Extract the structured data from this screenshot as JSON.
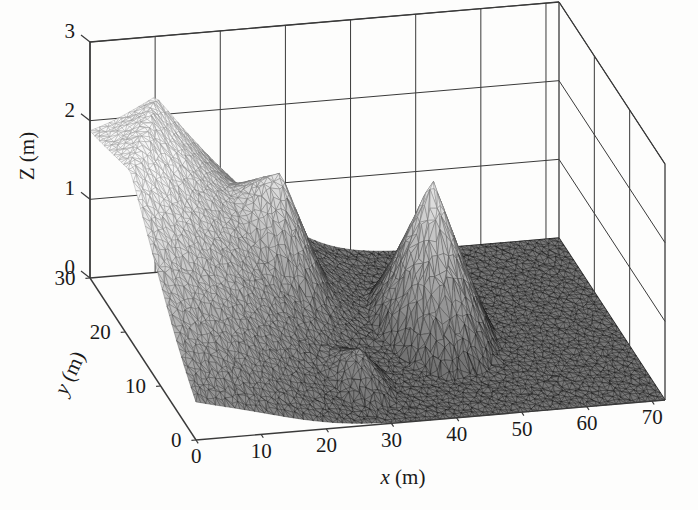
{
  "figure": {
    "type": "surface-plot-3d",
    "background_color": "#fdfdfc",
    "line_color": "#3a3a3a"
  },
  "axes": {
    "x": {
      "label_italic": "x",
      "label_unit": "(m)",
      "label_full": "x (m)",
      "ticks": [
        0,
        10,
        20,
        30,
        40,
        50,
        60,
        70
      ],
      "tick_labels": [
        "0",
        "10",
        "20",
        "30",
        "40",
        "50",
        "60",
        "70"
      ],
      "min": 0,
      "max": 72
    },
    "y": {
      "label_italic": "y",
      "label_unit": "(m)",
      "label_full": "y (m)",
      "ticks": [
        0,
        10,
        20,
        30
      ],
      "tick_labels": [
        "0",
        "10",
        "20",
        "30"
      ],
      "min": 0,
      "max": 30
    },
    "z": {
      "label_italic": "Z",
      "label_unit": "(m)",
      "label_full": "Z (m)",
      "ticks": [
        0,
        1,
        2,
        3
      ],
      "tick_labels": [
        "0",
        "1",
        "2",
        "3"
      ],
      "min": 0,
      "max": 3
    }
  },
  "chart_data": {
    "type": "surface",
    "title": "",
    "xlabel": "x (m)",
    "ylabel": "y (m)",
    "zlabel": "Z (m)",
    "xlim": [
      0,
      72
    ],
    "ylim": [
      0,
      30
    ],
    "zlim": [
      0,
      3
    ],
    "xticks": [
      0,
      10,
      20,
      30,
      40,
      50,
      60,
      70
    ],
    "yticks": [
      0,
      10,
      20,
      30
    ],
    "zticks": [
      0,
      1,
      2,
      3
    ],
    "grid": true,
    "legend": "none",
    "mesh": "unstructured-triangular",
    "shading": "grayscale-interp",
    "view_azimuth_deg": -37,
    "view_elevation_deg": 24,
    "features": [
      {
        "name": "ridge-embankment",
        "shape": "ridge",
        "peak_height_m": 1.75,
        "center_x_m": 7,
        "center_y_m": 27,
        "extent_x_m": 16,
        "extent_y_m": 40,
        "orientation_deg": 30,
        "shade": "dark"
      },
      {
        "name": "mid-hill",
        "shape": "cone",
        "peak_height_m": 0.78,
        "center_x_m": 25,
        "center_y_m": 22,
        "radius_m": 7,
        "shade": "medium"
      },
      {
        "name": "small-mound",
        "shape": "cone",
        "peak_height_m": 0.42,
        "center_x_m": 29,
        "center_y_m": 7,
        "radius_m": 5,
        "shade": "medium"
      },
      {
        "name": "tall-cone",
        "shape": "cone",
        "peak_height_m": 1.92,
        "center_x_m": 45,
        "center_y_m": 16,
        "radius_m": 9,
        "shade": "light"
      }
    ],
    "base_plane_height_m": 0.0
  }
}
